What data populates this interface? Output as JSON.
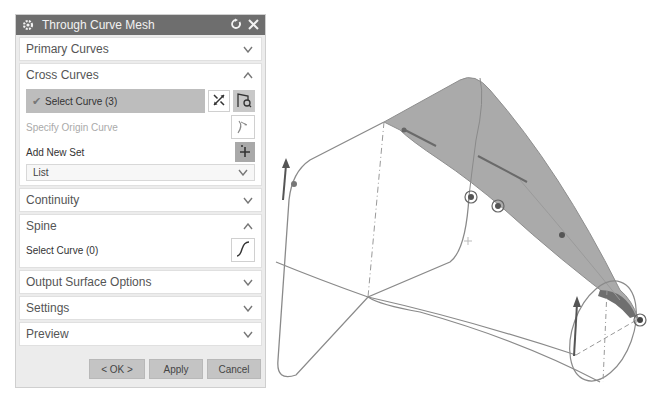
{
  "dialog": {
    "title": "Through Curve Mesh",
    "icons": {
      "settings": "gear-icon",
      "reset": "reset-icon",
      "close": "close-icon"
    },
    "sections": {
      "primary_curves": {
        "label": "Primary Curves",
        "state": "collapsed"
      },
      "cross_curves": {
        "label": "Cross Curves",
        "state": "expanded",
        "select_curve_label": "Select Curve (3)",
        "specify_origin_label": "Specify Origin Curve",
        "add_new_set_label": "Add New Set",
        "list_label": "List"
      },
      "continuity": {
        "label": "Continuity",
        "state": "collapsed"
      },
      "spine": {
        "label": "Spine",
        "state": "expanded",
        "select_curve_label": "Select Curve (0)"
      },
      "output_surface_options": {
        "label": "Output Surface Options",
        "state": "collapsed"
      },
      "settings": {
        "label": "Settings",
        "state": "collapsed"
      },
      "preview": {
        "label": "Preview",
        "state": "collapsed"
      }
    },
    "buttons": {
      "ok": "< OK >",
      "apply": "Apply",
      "cancel": "Cancel"
    }
  },
  "viewport": {
    "description": "3D graphics window with wireframe curves and a shaded mesh surface preview",
    "surface_color": "#a8a8a8",
    "curve_color": "#8a8a8a"
  }
}
